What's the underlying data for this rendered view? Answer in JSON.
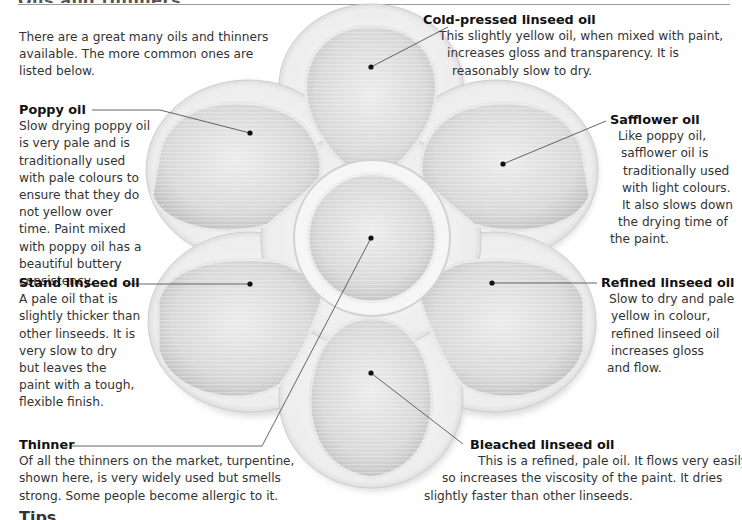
{
  "header": {
    "title": "Oils and thinners"
  },
  "intro": {
    "lines": [
      "There are a great many oils and thinners",
      "available. The more common ones are",
      "listed below."
    ]
  },
  "entries": {
    "poppy": {
      "title": "Poppy oil",
      "lines": [
        "Slow drying poppy oil",
        "is very pale and is",
        "traditionally used",
        "with pale colours to",
        "ensure that they do",
        "not yellow over",
        "time. Paint mixed",
        "with poppy oil has a",
        "beautiful buttery",
        "consistency."
      ]
    },
    "stand": {
      "title": "Stand linseed oil",
      "lines": [
        "A pale oil that is",
        "slightly thicker than",
        "other linseeds. It is",
        "very slow to dry",
        "but leaves the",
        "paint with a tough,",
        "flexible finish."
      ]
    },
    "thinner": {
      "title": "Thinner",
      "lines": [
        "Of all the thinners on the market, turpentine,",
        "shown here, is very widely used but smells",
        "strong. Some people become allergic to it."
      ]
    },
    "cold_pressed": {
      "title": "Cold-pressed linseed oil",
      "lines": [
        "This slightly yellow oil, when mixed with paint,",
        "increases gloss and transparency. It is",
        "reasonably slow to dry."
      ]
    },
    "safflower": {
      "title": "Safflower oil",
      "lines": [
        "Like poppy oil,",
        "safflower oil is",
        "traditionally used",
        "with light colours.",
        "It also slows down",
        "the drying time of",
        "the paint."
      ]
    },
    "refined": {
      "title": "Refined linseed oil",
      "lines": [
        "Slow to dry and pale",
        "yellow in colour,",
        "refined linseed oil",
        "increases gloss",
        "and flow."
      ]
    },
    "bleached": {
      "title": "Bleached linseed oil",
      "lines": [
        "This is a refined, pale oil. It flows very easily, and",
        "so increases the viscosity of the paint. It dries",
        "slightly faster than other linseeds."
      ]
    }
  },
  "next_heading": "Tips",
  "image": {
    "subject": "flower-shaped white palette with six petal wells and central well",
    "color_palette": "#f2f2f2",
    "well_shade": "#d9d9d9",
    "leader_color": "#555555"
  }
}
